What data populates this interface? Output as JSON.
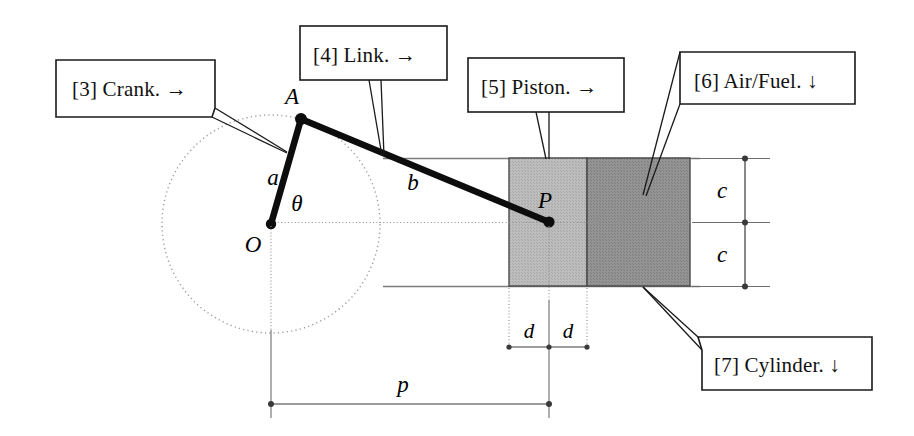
{
  "figure": {
    "background_color": "#ffffff"
  },
  "callouts": [
    {
      "id": "crank",
      "label": "[3] Crank.  →",
      "number": "[3]",
      "name": "Crank.",
      "arrow": "→"
    },
    {
      "id": "link",
      "label": "[4] Link.  →",
      "number": "[4]",
      "name": "Link.",
      "arrow": "→"
    },
    {
      "id": "piston",
      "label": "[5] Piston.  →",
      "number": "[5]",
      "name": "Piston.",
      "arrow": "→"
    },
    {
      "id": "airfuel",
      "label": "[6] Air/Fuel.  ↓",
      "number": "[6]",
      "name": "Air/Fuel.",
      "arrow": "↓"
    },
    {
      "id": "cylinder",
      "label": "[7] Cylinder.  ↓",
      "number": "[7]",
      "name": "Cylinder.",
      "arrow": "↓"
    }
  ],
  "point_labels": {
    "a_point": "A",
    "o_point": "O",
    "p_point": "P"
  },
  "dimension_labels": {
    "crank_length": "a",
    "link_length": "b",
    "bore_half_upper": "c",
    "bore_half_lower": "c",
    "piston_half_left": "d",
    "piston_half_right": "d",
    "crank_to_piston": "p",
    "crank_angle": "θ"
  },
  "colors": {
    "piston_fill": "#b8b8b8",
    "charge_fill": "#8e8e8e",
    "outline": "#4a4a4a",
    "line": "#1a1a1a",
    "dim": "#3a3a3a",
    "dotted": "#9a9a9a",
    "background": "#ffffff"
  },
  "geometry": {
    "origin_O": {
      "x": 271,
      "y": 224
    },
    "crank_pin_A": {
      "x": 301,
      "y": 119
    },
    "piston_pin_P": {
      "x": 549,
      "y": 222
    },
    "crank_circle_radius": 109,
    "piston_rect": {
      "x": 509,
      "y": 158,
      "width": 78,
      "height": 128
    },
    "charge_rect": {
      "x": 587,
      "y": 158,
      "width": 103,
      "height": 128
    }
  }
}
